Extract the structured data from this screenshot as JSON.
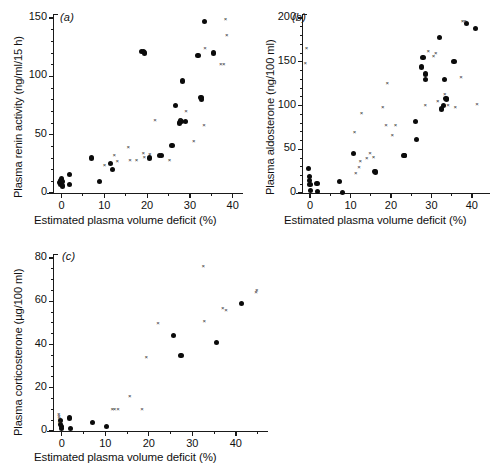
{
  "figure": {
    "background": "#ffffff",
    "panel_count": 3,
    "marker_colors": {
      "circle": "#0b0b0b",
      "cross": "#2a2a2a"
    }
  },
  "chart_data": [
    {
      "type": "scatter",
      "panel": "a",
      "panel_label": "(a)",
      "title": "",
      "xlabel": "Estimated plasma volume deficit (%)",
      "ylabel": "Plasma renin activity (ng/ml/15 h)",
      "xlim": [
        -2,
        41
      ],
      "ylim": [
        0,
        150
      ],
      "xticks": [
        0,
        10,
        20,
        30,
        40
      ],
      "yticks": [
        0,
        50,
        100,
        150
      ],
      "xtick_labels": [
        "0",
        "10",
        "20",
        "30",
        "40"
      ],
      "ytick_labels": [
        "0",
        "50",
        "100",
        "150"
      ],
      "minor_xtick_step": 5,
      "minor_ytick_step": 10,
      "grid": false,
      "legend": null,
      "series": [
        {
          "name": "circle",
          "marker": "filled-circle",
          "points": [
            [
              -0.4,
              9
            ],
            [
              -0.3,
              11
            ],
            [
              -0.2,
              7
            ],
            [
              -0.1,
              12
            ],
            [
              0.0,
              8
            ],
            [
              0.1,
              10
            ],
            [
              0.2,
              6
            ],
            [
              1.8,
              16
            ],
            [
              1.9,
              7
            ],
            [
              7.0,
              30
            ],
            [
              8.8,
              10
            ],
            [
              11.5,
              25
            ],
            [
              12.0,
              20
            ],
            [
              18.7,
              121
            ],
            [
              19.2,
              121
            ],
            [
              19.4,
              120
            ],
            [
              22.9,
              32
            ],
            [
              23.3,
              32
            ],
            [
              20.6,
              30
            ],
            [
              25.8,
              41
            ],
            [
              26.6,
              75
            ],
            [
              27.8,
              62
            ],
            [
              28.1,
              61
            ],
            [
              28.9,
              61
            ],
            [
              28.2,
              96
            ],
            [
              27.6,
              60
            ],
            [
              31.9,
              118
            ],
            [
              33.4,
              147
            ],
            [
              32.6,
              82
            ],
            [
              32.7,
              80
            ],
            [
              35.6,
              120
            ]
          ]
        },
        {
          "name": "cross",
          "marker": "x",
          "points": [
            [
              10.3,
              24
            ],
            [
              12.6,
              32
            ],
            [
              13.3,
              27
            ],
            [
              15.9,
              39
            ],
            [
              16.3,
              28
            ],
            [
              17.8,
              28
            ],
            [
              19.4,
              34
            ],
            [
              19.6,
              31
            ],
            [
              20.9,
              33
            ],
            [
              22.1,
              62
            ],
            [
              25.5,
              28
            ],
            [
              28.1,
              63
            ],
            [
              29.4,
              70
            ],
            [
              31.2,
              44
            ],
            [
              33.6,
              58
            ],
            [
              33.8,
              124
            ],
            [
              37.5,
              110
            ],
            [
              38.2,
              110
            ],
            [
              38.6,
              149
            ],
            [
              38.9,
              135
            ]
          ]
        }
      ]
    },
    {
      "type": "scatter",
      "panel": "b",
      "panel_label": "(b)",
      "title": "",
      "xlabel": "Estimated plasma volume deficit (%)",
      "ylabel": "Plasma aldosterone (ng/100 ml)",
      "xlim": [
        -2,
        43
      ],
      "ylim": [
        0,
        200
      ],
      "xticks": [
        0,
        10,
        20,
        30,
        40
      ],
      "yticks": [
        0,
        50,
        100,
        150,
        200
      ],
      "xtick_labels": [
        "0",
        "10",
        "20",
        "30",
        "40"
      ],
      "ytick_labels": [
        "0",
        "50",
        "100",
        "150",
        "200"
      ],
      "minor_xtick_step": 5,
      "minor_ytick_step": 10,
      "grid": false,
      "legend": null,
      "series": [
        {
          "name": "circle",
          "marker": "filled-circle",
          "points": [
            [
              -0.3,
              28
            ],
            [
              -0.2,
              19
            ],
            [
              -0.1,
              14
            ],
            [
              0.0,
              10
            ],
            [
              0.1,
              3
            ],
            [
              1.7,
              11
            ],
            [
              1.9,
              2
            ],
            [
              7.2,
              13
            ],
            [
              8.0,
              1
            ],
            [
              10.7,
              45
            ],
            [
              15.9,
              25
            ],
            [
              16.2,
              24
            ],
            [
              23.2,
              43
            ],
            [
              23.4,
              43
            ],
            [
              26.0,
              82
            ],
            [
              26.4,
              61
            ],
            [
              27.6,
              144
            ],
            [
              27.9,
              155
            ],
            [
              28.5,
              136
            ],
            [
              28.6,
              130
            ],
            [
              31.9,
              178
            ],
            [
              32.4,
              96
            ],
            [
              33.2,
              130
            ],
            [
              33.6,
              108
            ],
            [
              33.8,
              107
            ],
            [
              32.9,
              100
            ],
            [
              35.6,
              150
            ],
            [
              38.6,
              194
            ],
            [
              41.0,
              188
            ]
          ]
        },
        {
          "name": "cross",
          "marker": "x",
          "points": [
            [
              -0.6,
              166
            ],
            [
              -0.9,
              148
            ],
            [
              11.3,
              70
            ],
            [
              11.6,
              23
            ],
            [
              12.4,
              30
            ],
            [
              12.7,
              36
            ],
            [
              13.0,
              91
            ],
            [
              14.3,
              40
            ],
            [
              15.1,
              46
            ],
            [
              16.0,
              41
            ],
            [
              18.3,
              98
            ],
            [
              19.1,
              77
            ],
            [
              19.4,
              125
            ],
            [
              20.6,
              66
            ],
            [
              21.4,
              78
            ],
            [
              28.8,
              100
            ],
            [
              30.8,
              156
            ],
            [
              31.4,
              160
            ],
            [
              31.9,
              105
            ],
            [
              33.6,
              113
            ],
            [
              36.2,
              98
            ],
            [
              37.6,
              132
            ],
            [
              38.0,
              196
            ],
            [
              38.6,
              196
            ],
            [
              41.6,
              102
            ],
            [
              34.4,
              100
            ],
            [
              29.5,
              162
            ]
          ]
        }
      ]
    },
    {
      "type": "scatter",
      "panel": "c",
      "panel_label": "(c)",
      "title": "",
      "xlabel": "Estimated plasma volume deficit (%)",
      "ylabel": "Plasma corticosterone (µg/100 ml)",
      "xlim": [
        -2,
        46
      ],
      "ylim": [
        0,
        80
      ],
      "xticks": [
        0,
        10,
        20,
        30,
        40
      ],
      "yticks": [
        0,
        20,
        40,
        60,
        80
      ],
      "xtick_labels": [
        "0",
        "10",
        "20",
        "30",
        "40"
      ],
      "ytick_labels": [
        "0",
        "20",
        "40",
        "60",
        "80"
      ],
      "minor_xtick_step": 5,
      "minor_ytick_step": 5,
      "grid": false,
      "legend": null,
      "series": [
        {
          "name": "circle",
          "marker": "filled-circle",
          "points": [
            [
              -0.3,
              5
            ],
            [
              -0.2,
              3
            ],
            [
              -0.1,
              2
            ],
            [
              0.0,
              1
            ],
            [
              1.8,
              6
            ],
            [
              2.0,
              1
            ],
            [
              7.0,
              4
            ],
            [
              10.2,
              2
            ],
            [
              25.7,
              44
            ],
            [
              27.4,
              35
            ],
            [
              35.6,
              41
            ],
            [
              41.2,
              59
            ]
          ]
        },
        {
          "name": "cross",
          "marker": "x",
          "points": [
            [
              -0.4,
              8
            ],
            [
              -0.35,
              7
            ],
            [
              -0.3,
              6
            ],
            [
              -0.25,
              4
            ],
            [
              11.9,
              10
            ],
            [
              12.4,
              10
            ],
            [
              13.2,
              10
            ],
            [
              15.9,
              16
            ],
            [
              18.7,
              10
            ],
            [
              19.7,
              34
            ],
            [
              22.4,
              50
            ],
            [
              32.8,
              76
            ],
            [
              33.0,
              51
            ],
            [
              38.0,
              56
            ],
            [
              37.3,
              57
            ],
            [
              44.9,
              64
            ],
            [
              45.1,
              65
            ]
          ]
        }
      ]
    }
  ]
}
